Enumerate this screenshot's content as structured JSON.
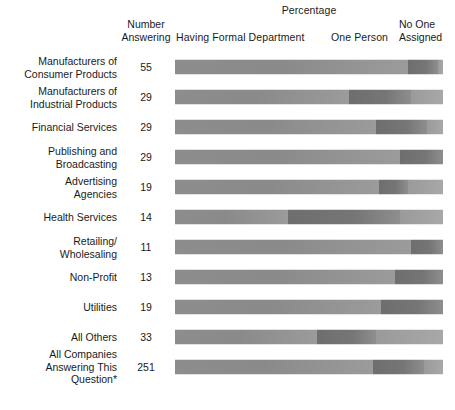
{
  "header": {
    "percentage_label": "Percentage",
    "number_line1": "Number",
    "number_line2": "Answering",
    "formal_label": "Having Formal Department",
    "one_person_label": "One Person",
    "no_one_line1": "No One",
    "no_one_line2": "Assigned"
  },
  "chart_data": {
    "type": "bar",
    "title": "Percentage",
    "subtitle": "",
    "xlabel": "Percentage",
    "ylabel": "",
    "xlim": [
      0,
      100
    ],
    "grid": false,
    "legend_position": "top",
    "orientation": "horizontal",
    "stacked": true,
    "categories": [
      "Manufacturers of Consumer Products",
      "Manufacturers of Industrial Products",
      "Financial Services",
      "Publishing and Broadcasting",
      "Advertising Agencies",
      "Health Services",
      "Retailing/ Wholesaling",
      "Non-Profit",
      "Utilities",
      "All Others",
      "All Companies Answering This Question*"
    ],
    "series": [
      {
        "name": "Having Formal Department",
        "values": [
          87,
          65,
          75,
          84,
          76,
          42,
          88,
          82,
          77,
          53,
          74
        ]
      },
      {
        "name": "One Person",
        "values": [
          11,
          23,
          19,
          16,
          11,
          42,
          12,
          18,
          23,
          22,
          19
        ]
      },
      {
        "name": "No One Assigned",
        "values": [
          2,
          12,
          6,
          0,
          13,
          16,
          0,
          0,
          0,
          25,
          7
        ]
      }
    ],
    "number_answering": [
      55,
      29,
      29,
      29,
      19,
      14,
      11,
      13,
      19,
      33,
      251
    ],
    "colors": {
      "formal": "#8d8d8d",
      "one_person": "#6e6e6e",
      "no_one": "#a0a0a0",
      "background": "#ffffff",
      "text": "#1a1a1a"
    }
  },
  "rows": [
    {
      "label_line1": "Manufacturers of",
      "label_line2": "Consumer Products",
      "count": "55",
      "formal": 87,
      "one_person": 11,
      "no_one": 2
    },
    {
      "label_line1": "Manufacturers of",
      "label_line2": "Industrial Products",
      "count": "29",
      "formal": 65,
      "one_person": 23,
      "no_one": 12
    },
    {
      "label_line1": "Financial Services",
      "label_line2": "",
      "count": "29",
      "formal": 75,
      "one_person": 19,
      "no_one": 6
    },
    {
      "label_line1": "Publishing and",
      "label_line2": "Broadcasting",
      "count": "29",
      "formal": 84,
      "one_person": 16,
      "no_one": 0
    },
    {
      "label_line1": "Advertising",
      "label_line2": "Agencies",
      "count": "19",
      "formal": 76,
      "one_person": 11,
      "no_one": 13
    },
    {
      "label_line1": "Health Services",
      "label_line2": "",
      "count": "14",
      "formal": 42,
      "one_person": 42,
      "no_one": 16
    },
    {
      "label_line1": "Retailing/",
      "label_line2": "Wholesaling",
      "count": "11",
      "formal": 88,
      "one_person": 12,
      "no_one": 0
    },
    {
      "label_line1": "Non-Profit",
      "label_line2": "",
      "count": "13",
      "formal": 82,
      "one_person": 18,
      "no_one": 0
    },
    {
      "label_line1": "Utilities",
      "label_line2": "",
      "count": "19",
      "formal": 77,
      "one_person": 23,
      "no_one": 0
    },
    {
      "label_line1": "All Others",
      "label_line2": "",
      "count": "33",
      "formal": 53,
      "one_person": 22,
      "no_one": 25
    },
    {
      "label_line1": "All Companies",
      "label_line2": "Answering This Question*",
      "count": "251",
      "formal": 74,
      "one_person": 19,
      "no_one": 7
    }
  ]
}
